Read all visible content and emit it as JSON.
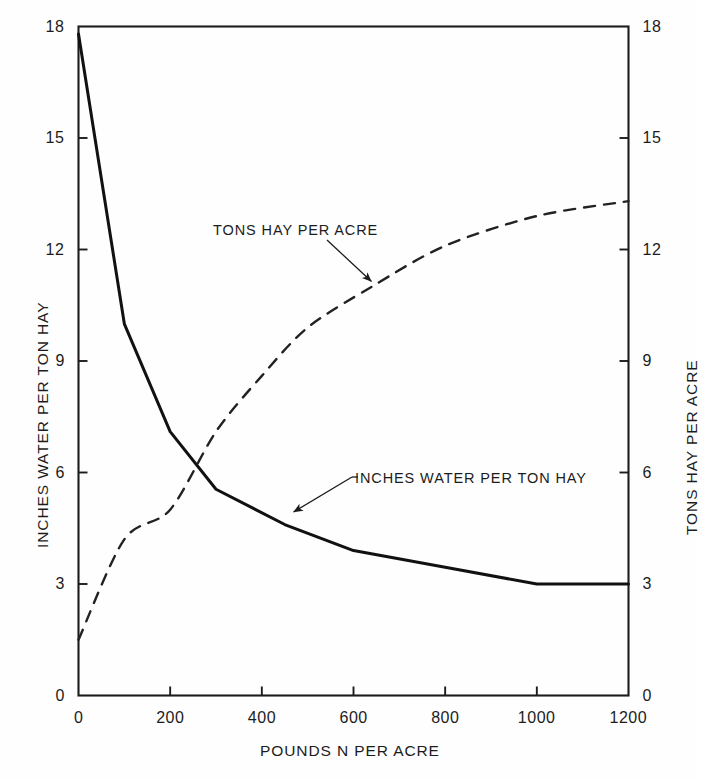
{
  "figure": {
    "background": "#fefefe",
    "ink_color": "#1c1c1c"
  },
  "axes": {
    "left": {
      "title": "INCHES WATER PER TON HAY",
      "ticks": [
        "0",
        "3",
        "6",
        "9",
        "12",
        "15",
        "18"
      ],
      "min": 0,
      "max": 18
    },
    "right": {
      "title": "TONS HAY PER ACRE",
      "ticks": [
        "0",
        "3",
        "6",
        "9",
        "12",
        "15",
        "18"
      ],
      "min": 0,
      "max": 18
    },
    "bottom": {
      "title": "POUNDS N PER ACRE",
      "ticks": [
        "0",
        "200",
        "400",
        "600",
        "800",
        "1000",
        "1200"
      ],
      "min": 0,
      "max": 1200
    }
  },
  "annotations": [
    {
      "name": "tons-hay-per-acre",
      "text": "TONS HAY PER ACRE"
    },
    {
      "name": "inches-water-per-ton-hay",
      "text": "INCHES WATER PER TON HAY"
    }
  ],
  "chart_data": {
    "type": "line",
    "title": "",
    "xlabel": "POUNDS N PER ACRE",
    "ylabel": "INCHES WATER PER TON HAY",
    "ylabel_right": "TONS HAY PER ACRE",
    "xlim": [
      0,
      1200
    ],
    "ylim": [
      0,
      18
    ],
    "ylim_right": [
      0,
      18
    ],
    "xticks": [
      0,
      200,
      400,
      600,
      800,
      1000,
      1200
    ],
    "yticks": [
      0,
      3,
      6,
      9,
      12,
      15,
      18
    ],
    "yticks_right": [
      0,
      3,
      6,
      9,
      12,
      15,
      18
    ],
    "grid": false,
    "legend": "inline-annotations",
    "series": [
      {
        "name": "INCHES WATER PER TON HAY",
        "axis": "left",
        "style": "solid",
        "color": "#111111",
        "linewidth": 3,
        "x": [
          0,
          100,
          200,
          300,
          450,
          600,
          800,
          1000,
          1200
        ],
        "values": [
          17.8,
          10.0,
          7.1,
          5.55,
          4.6,
          3.9,
          3.45,
          3.0,
          3.0
        ]
      },
      {
        "name": "TONS HAY PER ACRE",
        "axis": "right",
        "style": "dashed",
        "color": "#222222",
        "linewidth": 2.4,
        "x": [
          0,
          100,
          200,
          300,
          400,
          500,
          640,
          800,
          1000,
          1200
        ],
        "values": [
          1.5,
          4.2,
          5.0,
          7.1,
          8.6,
          9.9,
          11.0,
          12.1,
          12.9,
          13.3
        ]
      }
    ]
  }
}
